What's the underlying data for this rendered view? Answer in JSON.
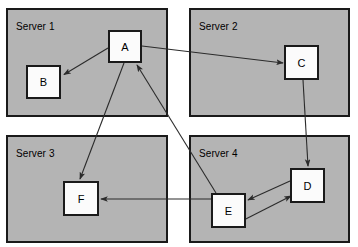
{
  "diagram": {
    "background_color": "#ffffff",
    "panel_fill": "#b4b4b4",
    "panel_stroke": "#1a1a1a",
    "node_fill": "#fbfbfb",
    "node_stroke": "#1a1a1a",
    "edge_color": "#2b2b2b",
    "servers": [
      {
        "id": "server1",
        "label": "Server 1",
        "x": 6,
        "y": 8,
        "w": 162,
        "h": 109,
        "label_x": 16,
        "label_y": 21
      },
      {
        "id": "server2",
        "label": "Server 2",
        "x": 189,
        "y": 8,
        "w": 161,
        "h": 109,
        "label_x": 199,
        "label_y": 21
      },
      {
        "id": "server3",
        "label": "Server 3",
        "x": 6,
        "y": 135,
        "w": 162,
        "h": 108,
        "label_x": 16,
        "label_y": 148
      },
      {
        "id": "server4",
        "label": "Server 4",
        "x": 189,
        "y": 135,
        "w": 161,
        "h": 108,
        "label_x": 199,
        "label_y": 148
      }
    ],
    "nodes": [
      {
        "id": "A",
        "label": "A",
        "server": "server1",
        "x": 108,
        "y": 30,
        "w": 34,
        "h": 33
      },
      {
        "id": "B",
        "label": "B",
        "server": "server1",
        "x": 26,
        "y": 65,
        "w": 35,
        "h": 34
      },
      {
        "id": "C",
        "label": "C",
        "server": "server2",
        "x": 284,
        "y": 45,
        "w": 35,
        "h": 35
      },
      {
        "id": "D",
        "label": "D",
        "server": "server4",
        "x": 290,
        "y": 168,
        "w": 35,
        "h": 35
      },
      {
        "id": "E",
        "label": "E",
        "server": "server4",
        "x": 211,
        "y": 193,
        "w": 35,
        "h": 35
      },
      {
        "id": "F",
        "label": "F",
        "server": "server3",
        "x": 63,
        "y": 181,
        "w": 36,
        "h": 35
      }
    ],
    "edges": [
      {
        "id": "a-to-b",
        "from": "A",
        "to": "B",
        "x1": 108,
        "y1": 48,
        "x2": 63,
        "y2": 75,
        "arrow": "end"
      },
      {
        "id": "a-to-c",
        "from": "A",
        "to": "C",
        "x1": 142,
        "y1": 46,
        "x2": 283,
        "y2": 63,
        "arrow": "end"
      },
      {
        "id": "a-to-f",
        "from": "A",
        "to": "F",
        "x1": 124,
        "y1": 63,
        "x2": 80,
        "y2": 180,
        "arrow": "end"
      },
      {
        "id": "c-to-d",
        "from": "C",
        "to": "D",
        "x1": 303,
        "y1": 80,
        "x2": 308,
        "y2": 167,
        "arrow": "end"
      },
      {
        "id": "d-to-e",
        "from": "D",
        "to": "E",
        "x1": 290,
        "y1": 181,
        "x2": 247,
        "y2": 200,
        "arrow": "end"
      },
      {
        "id": "e-to-d",
        "from": "E",
        "to": "D",
        "x1": 230,
        "y1": 227,
        "x2": 291,
        "y2": 196,
        "arrow": "end"
      },
      {
        "id": "e-to-f",
        "from": "E",
        "to": "F",
        "x1": 211,
        "y1": 199,
        "x2": 100,
        "y2": 199,
        "arrow": "end"
      },
      {
        "id": "e-to-a",
        "from": "E",
        "to": "A",
        "x1": 216,
        "y1": 193,
        "x2": 136,
        "y2": 64,
        "arrow": "end"
      }
    ]
  }
}
